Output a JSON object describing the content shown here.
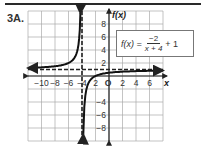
{
  "problem_label": "3A.",
  "equation": {
    "lhs": "f(x) =",
    "numerator": "−2",
    "denominator": "x + 4",
    "tail": "+ 1"
  },
  "chart_data": {
    "type": "line",
    "title": "",
    "function": "f(x) = -2/(x+4) + 1",
    "xlabel": "x",
    "ylabel": "f(x)",
    "xlim": [
      -12,
      8
    ],
    "ylim": [
      -10,
      10
    ],
    "grid": true,
    "grid_step": 2,
    "x_ticks": [
      -10,
      -8,
      -6,
      -4,
      -2,
      0,
      2,
      4,
      6
    ],
    "x_tick_labels": [
      "−10",
      "−8",
      "−6",
      "−4",
      "2",
      "O",
      "2",
      "4",
      "6"
    ],
    "y_ticks": [
      8,
      6,
      4,
      2,
      -4,
      -6,
      -8
    ],
    "y_tick_labels": [
      "8",
      "6",
      "4",
      "2",
      "−4",
      "−6",
      "−8"
    ],
    "asymptotes": {
      "vertical": -4,
      "horizontal": 1
    },
    "series": [
      {
        "name": "left branch",
        "x": [
          -12,
          -10,
          -8,
          -6,
          -5,
          -4.5,
          -4.25
        ],
        "y": [
          1.25,
          1.33,
          1.5,
          2,
          3,
          5,
          9
        ]
      },
      {
        "name": "right branch",
        "x": [
          -3.8,
          -3.5,
          -3,
          -2,
          0,
          2,
          4,
          6,
          8
        ],
        "y": [
          -9,
          -3,
          -1,
          0,
          0.5,
          0.67,
          0.75,
          0.8,
          0.83
        ]
      }
    ]
  }
}
